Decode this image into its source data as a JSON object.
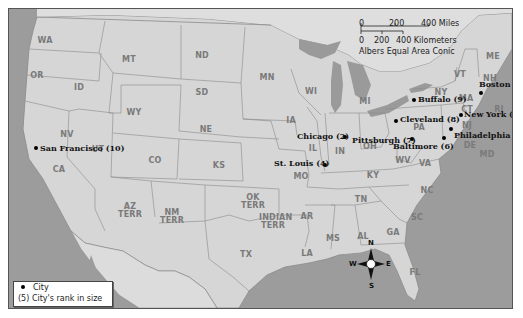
{
  "map": {
    "caption_fragment": "g                   p",
    "projection": "Albers Equal Area Conic",
    "scale_bar": {
      "miles_ticks": [
        "0",
        "200",
        "400 Miles"
      ],
      "km_ticks": [
        "0",
        "200",
        "400 Kilometers"
      ]
    },
    "states": [
      {
        "abbr": "WA",
        "x": 36,
        "y": 28
      },
      {
        "abbr": "OR",
        "x": 28,
        "y": 63
      },
      {
        "abbr": "ID",
        "x": 70,
        "y": 75
      },
      {
        "abbr": "MT",
        "x": 120,
        "y": 47
      },
      {
        "abbr": "WY",
        "x": 125,
        "y": 100
      },
      {
        "abbr": "ND",
        "x": 193,
        "y": 43
      },
      {
        "abbr": "SD",
        "x": 193,
        "y": 80
      },
      {
        "abbr": "MN",
        "x": 258,
        "y": 65
      },
      {
        "abbr": "NE",
        "x": 197,
        "y": 117
      },
      {
        "abbr": "WI",
        "x": 302,
        "y": 79
      },
      {
        "abbr": "MI",
        "x": 356,
        "y": 89
      },
      {
        "abbr": "IA",
        "x": 282,
        "y": 108
      },
      {
        "abbr": "NV",
        "x": 58,
        "y": 122
      },
      {
        "abbr": "UT",
        "x": 89,
        "y": 137
      },
      {
        "abbr": "CO",
        "x": 146,
        "y": 148
      },
      {
        "abbr": "KS",
        "x": 210,
        "y": 153
      },
      {
        "abbr": "IL",
        "x": 304,
        "y": 136
      },
      {
        "abbr": "IN",
        "x": 331,
        "y": 139
      },
      {
        "abbr": "OH",
        "x": 361,
        "y": 134
      },
      {
        "abbr": "MO",
        "x": 292,
        "y": 164
      },
      {
        "abbr": "KY",
        "x": 364,
        "y": 163
      },
      {
        "abbr": "WV",
        "x": 394,
        "y": 148
      },
      {
        "abbr": "VA",
        "x": 416,
        "y": 151
      },
      {
        "abbr": "PA",
        "x": 410,
        "y": 115
      },
      {
        "abbr": "NY",
        "x": 432,
        "y": 80
      },
      {
        "abbr": "VT",
        "x": 451,
        "y": 62
      },
      {
        "abbr": "NH",
        "x": 481,
        "y": 66
      },
      {
        "abbr": "ME",
        "x": 484,
        "y": 44
      },
      {
        "abbr": "MA",
        "x": 457,
        "y": 86
      },
      {
        "abbr": "CT",
        "x": 458,
        "y": 97
      },
      {
        "abbr": "RI",
        "x": 490,
        "y": 97
      },
      {
        "abbr": "NJ",
        "x": 458,
        "y": 113
      },
      {
        "abbr": "DE",
        "x": 461,
        "y": 133
      },
      {
        "abbr": "MD",
        "x": 478,
        "y": 142
      },
      {
        "abbr": "NC",
        "x": 418,
        "y": 178
      },
      {
        "abbr": "SC",
        "x": 408,
        "y": 205
      },
      {
        "abbr": "GA",
        "x": 384,
        "y": 220
      },
      {
        "abbr": "AL",
        "x": 354,
        "y": 224
      },
      {
        "abbr": "MS",
        "x": 324,
        "y": 226
      },
      {
        "abbr": "TN",
        "x": 352,
        "y": 187
      },
      {
        "abbr": "AR",
        "x": 298,
        "y": 204
      },
      {
        "abbr": "LA",
        "x": 298,
        "y": 241
      },
      {
        "abbr": "TX",
        "x": 237,
        "y": 242
      },
      {
        "abbr": "FL",
        "x": 406,
        "y": 260
      },
      {
        "abbr": "CA",
        "x": 50,
        "y": 157
      },
      {
        "abbr": "AZ\nTERR",
        "x": 121,
        "y": 194
      },
      {
        "abbr": "NM\nTERR",
        "x": 163,
        "y": 200
      },
      {
        "abbr": "OK\nTERR",
        "x": 244,
        "y": 185
      },
      {
        "abbr": "INDIAN\nTERR",
        "x": 264,
        "y": 205
      }
    ],
    "cities": [
      {
        "name": "San Francisco",
        "rank": "(10)",
        "label": "San Francisco (10)",
        "dot_x": 27,
        "dot_y": 139,
        "label_x": 31,
        "label_y": 135
      },
      {
        "name": "Chicago",
        "rank": "(2)",
        "label": "Chicago (2)",
        "dot_x": 336,
        "dot_y": 128,
        "label_x": 288,
        "label_y": 123
      },
      {
        "name": "Pittsburgh",
        "rank": "(7)",
        "label": "Pittsburgh (7)",
        "dot_x": 403,
        "dot_y": 130,
        "label_x": 343,
        "label_y": 127
      },
      {
        "name": "St. Louis",
        "rank": "(4)",
        "label": "St. Louis (4)",
        "dot_x": 316,
        "dot_y": 156,
        "label_x": 265,
        "label_y": 150
      },
      {
        "name": "Cleveland",
        "rank": "(8)",
        "label": "Cleveland (8)",
        "dot_x": 387,
        "dot_y": 112,
        "label_x": 391,
        "label_y": 106
      },
      {
        "name": "Buffalo",
        "rank": "(9)",
        "label": "Buffalo (9)",
        "dot_x": 405,
        "dot_y": 91,
        "label_x": 409,
        "label_y": 86
      },
      {
        "name": "Boston",
        "rank": "(5)",
        "label": "Boston (5)",
        "dot_x": 472,
        "dot_y": 84,
        "label_x": 470,
        "label_y": 71
      },
      {
        "name": "New York",
        "rank": "(1)",
        "label": "New York (1)",
        "dot_x": 452,
        "dot_y": 106,
        "label_x": 455,
        "label_y": 101
      },
      {
        "name": "Philadelphia",
        "rank": "(3)",
        "label": "Philadelphia (3)",
        "dot_x": 442,
        "dot_y": 120,
        "label_x": 445,
        "label_y": 122
      },
      {
        "name": "Baltimore",
        "rank": "(6)",
        "label": "Baltimore (6)",
        "dot_x": 435,
        "dot_y": 129,
        "label_x": 384,
        "label_y": 133
      }
    ],
    "legend": {
      "city_label": "City",
      "rank_symbol": "(5)",
      "rank_label": "City's rank in size"
    },
    "compass": {
      "n": "N",
      "s": "S",
      "e": "E",
      "w": "W"
    },
    "colors": {
      "land": "#d8d8d8",
      "water": "#9c9c9c",
      "border": "#8a8a8a",
      "label": "#7a7a7a",
      "city": "#111111"
    }
  }
}
